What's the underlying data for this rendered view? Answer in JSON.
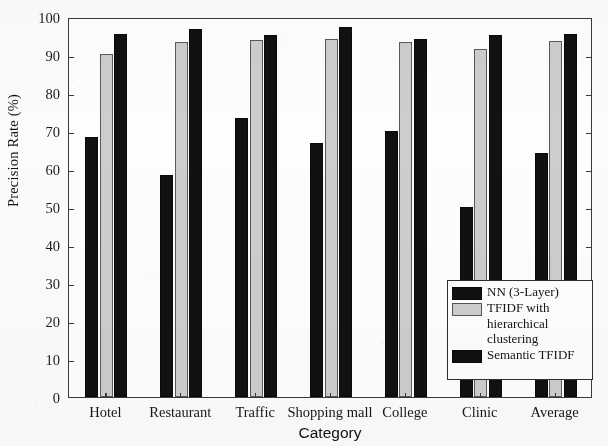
{
  "chart_data": {
    "type": "bar",
    "title": "",
    "xlabel": "Category",
    "ylabel": "Precision Rate (%)",
    "ylim": [
      0,
      100
    ],
    "ytick_labels": [
      "0",
      "10",
      "20",
      "30",
      "40",
      "50",
      "60",
      "70",
      "80",
      "90",
      "100"
    ],
    "yticks": [
      0,
      10,
      20,
      30,
      40,
      50,
      60,
      70,
      80,
      90,
      100
    ],
    "grid": false,
    "legend_position": "bottom-right",
    "categories": [
      "Hotel",
      "Restaurant",
      "Traffic",
      "Shopping mall",
      "College",
      "Clinic",
      "Average"
    ],
    "series": [
      {
        "name": "NN (3-Layer)",
        "color": "#111111",
        "values": [
          68.5,
          58.3,
          73.3,
          66.8,
          70.0,
          50.1,
          64.3
        ]
      },
      {
        "name": "TFIDF with hierarchical clustering",
        "color": "#cdcdcd",
        "values": [
          90.3,
          93.5,
          93.9,
          94.3,
          93.5,
          91.5,
          93.6
        ]
      },
      {
        "name": "Semantic TFIDF",
        "color": "#111111",
        "values": [
          95.4,
          96.8,
          95.3,
          97.4,
          94.3,
          95.3,
          95.6
        ]
      }
    ]
  },
  "legend": {
    "entries": [
      {
        "label": "NN (3-Layer)",
        "swatch": "dark"
      },
      {
        "label": "TFIDF with\nhierarchical\nclustering",
        "swatch": "light"
      },
      {
        "label": "Semantic TFIDF",
        "swatch": "dark"
      }
    ]
  }
}
